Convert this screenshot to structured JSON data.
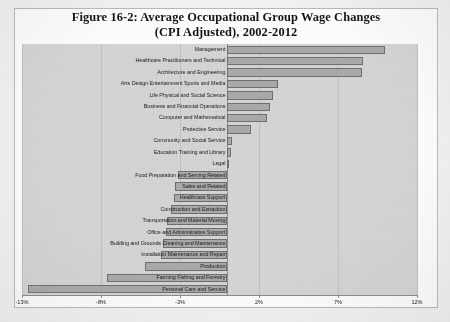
{
  "figure": {
    "title_line1": "Figure 16-2: Average Occupational Group Wage Changes",
    "title_line2": "(CPI Adjusted), 2002-2012"
  },
  "chart_data": {
    "type": "bar",
    "orientation": "horizontal",
    "title": "Figure 16-2: Average Occupational Group Wage Changes (CPI Adjusted), 2002-2012",
    "xlabel": "",
    "ylabel": "",
    "xlim": [
      -13,
      12
    ],
    "xticks": [
      -13,
      -8,
      -3,
      2,
      7,
      12
    ],
    "xtick_labels": [
      "-13%",
      "-8%",
      "-3%",
      "2%",
      "7%",
      "12%"
    ],
    "grid": true,
    "legend": "none",
    "value_unit": "percent",
    "categories": [
      "Management",
      "Healthcare Practitioners and Technical",
      "Architecture and Engineering",
      "Arts Design Entertainment Sports and Media",
      "Life Physical and Social Science",
      "Business and Financial Operations",
      "Computer and Mathematical",
      "Protective Service",
      "Community and Social Service",
      "Education Training and Library",
      "Legal",
      "Food Preparation and Serving Related",
      "Sales and Related",
      "Healthcare Support",
      "Construction and Extraction",
      "Transportation and Material Moving",
      "Office and Administrative Support",
      "Building and Grounds Cleaning and Maintenance",
      "Installation Maintenance and Repair",
      "Production",
      "Farming Fishing and Forestry",
      "Personal Care and Service"
    ],
    "values": [
      10.0,
      8.6,
      8.5,
      3.2,
      2.9,
      2.7,
      2.5,
      1.5,
      0.3,
      0.2,
      0.1,
      -3.1,
      -3.3,
      -3.4,
      -3.6,
      -3.8,
      -3.9,
      -4.1,
      -4.2,
      -5.2,
      -7.6,
      -12.6
    ]
  },
  "colors": {
    "bar_fill": "#a9a9a7",
    "bar_border": "#6f6f6d",
    "plot_background": "#d4d4d2",
    "page_background": "#fdfdfc",
    "text": "#1b1b1b"
  }
}
